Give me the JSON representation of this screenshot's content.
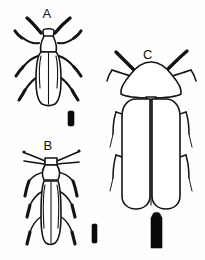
{
  "plate": {
    "title": "Beetle identification plate",
    "background_color": "#fefefe",
    "ink_color": "#111111",
    "width": 205,
    "height": 260,
    "view": "dorsal"
  },
  "figures": [
    {
      "id": "A",
      "label": "A",
      "label_x": 47,
      "label_y": 18,
      "description": "Elongate oval beetle, dorsal view, moderately broad elytra, short clubbed antennae",
      "scale_bar": {
        "name": "scale-bar-a",
        "x": 68,
        "y": 111,
        "width": 6,
        "height": 15,
        "color": "#0a0a0a"
      }
    },
    {
      "id": "B",
      "label": "B",
      "label_x": 48,
      "label_y": 150,
      "description": "Slender elongate beetle, dorsal view, narrow parallel-sided elytra, very long filiform antennae",
      "scale_bar": {
        "name": "scale-bar-b",
        "x": 92,
        "y": 224,
        "width": 5,
        "height": 19,
        "color": "#0a0a0a"
      }
    },
    {
      "id": "C",
      "label": "C",
      "label_x": 148,
      "label_y": 59,
      "description": "Large broad beetle, dorsal view, wide rounded pronotum and broad rounded elytra, thick antennae",
      "scale_bar": {
        "name": "scale-bar-c",
        "x": 151,
        "y": 214,
        "width": 11,
        "height": 34,
        "color": "#0a0a0a"
      }
    }
  ]
}
